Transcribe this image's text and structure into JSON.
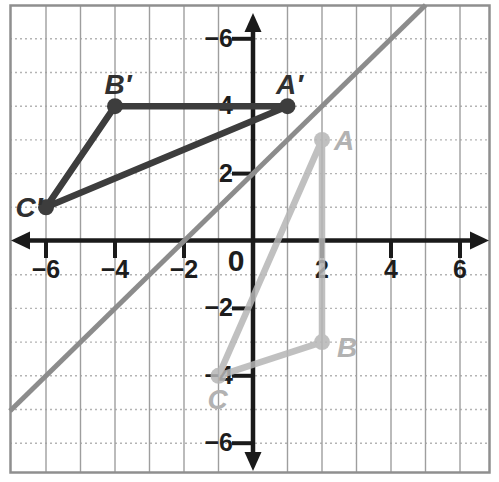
{
  "figure": {
    "background": "#ffffff",
    "frame_color": "#8f8f8f",
    "grid": {
      "x_min": -6,
      "x_max": 6,
      "y_min": -6,
      "y_max": 6,
      "vertical_line_color": "#9e9e9e",
      "horizontal_line_color": "#b4b4b4"
    },
    "axes": {
      "color": "#1a1a1a",
      "x_tick_labels": [
        {
          "value": -6,
          "text": "−6"
        },
        {
          "value": -4,
          "text": "−4"
        },
        {
          "value": -2,
          "text": "−2"
        },
        {
          "value": 0,
          "text": "0"
        },
        {
          "value": 2,
          "text": "2"
        },
        {
          "value": 4,
          "text": "4"
        },
        {
          "value": 6,
          "text": "6"
        }
      ],
      "y_tick_labels": [
        {
          "value": 6,
          "text": "−6"
        },
        {
          "value": 4,
          "text": "4"
        },
        {
          "value": 2,
          "text": "2"
        },
        {
          "value": -2,
          "text": "−2"
        },
        {
          "value": -4,
          "text": "−4"
        },
        {
          "value": -6,
          "text": "−6"
        }
      ]
    },
    "reflection_line": {
      "color": "#8c8c8c",
      "slope": 1,
      "y_intercept": 2
    },
    "triangle_image": {
      "color": "#3d3d3d",
      "label_color": "#303030",
      "vertices": [
        {
          "label": "A′",
          "x": 1,
          "y": 4,
          "ldx": 2,
          "ldy": -12
        },
        {
          "label": "B′",
          "x": -4,
          "y": 4,
          "ldx": 3,
          "ldy": -12
        },
        {
          "label": "C′",
          "x": -6,
          "y": 1,
          "ldx": -17,
          "ldy": 10
        }
      ]
    },
    "triangle_preimage": {
      "color": "#b6b6b6",
      "label_color": "#b2b2b2",
      "vertices": [
        {
          "label": "A",
          "x": 2,
          "y": 3,
          "ldx": 22,
          "ldy": 10
        },
        {
          "label": "B",
          "x": 2,
          "y": -3,
          "ldx": 25,
          "ldy": 15
        },
        {
          "label": "C",
          "x": -1,
          "y": -4,
          "ldx": -1,
          "ldy": 33
        }
      ]
    }
  },
  "chart_data": {
    "type": "geometry-graph",
    "x_axis": {
      "range": [
        -7,
        7
      ],
      "tick_labels_shown": [
        "−6",
        "−4",
        "−2",
        "0",
        "2",
        "4",
        "6"
      ]
    },
    "y_axis": {
      "range": [
        -7,
        7
      ],
      "tick_labels_shown": [
        "−6",
        "4",
        "2",
        "−2",
        "−4",
        "−6"
      ]
    },
    "grid": true,
    "reflection_line": {
      "equation": "y = x + 2",
      "passes_through": [
        [
          -2,
          0
        ],
        [
          0,
          2
        ]
      ]
    },
    "triangle_ABC": {
      "A": [
        2,
        3
      ],
      "B": [
        2,
        -3
      ],
      "C": [
        -1,
        -4
      ]
    },
    "triangle_A_prime_B_prime_C_prime": {
      "A'": [
        1,
        4
      ],
      "B'": [
        -4,
        4
      ],
      "C'": [
        -6,
        1
      ]
    }
  }
}
